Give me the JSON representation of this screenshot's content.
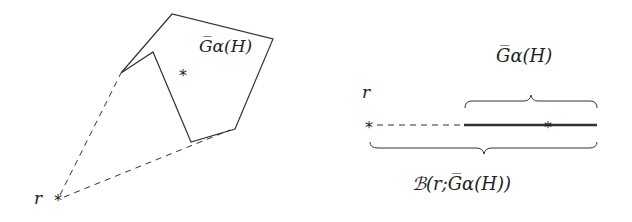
{
  "left_figure": {
    "set_label": "G̅α(H)",
    "point_label": "r",
    "polygon_points": [
      [
        121,
        73
      ],
      [
        172,
        14
      ],
      [
        273,
        39
      ],
      [
        235,
        129
      ],
      [
        191,
        142
      ],
      [
        153,
        52
      ]
    ],
    "interior_point": [
      182,
      72
    ],
    "external_point": [
      58,
      198
    ]
  },
  "right_figure": {
    "point_label": "r",
    "top_brace_label": "G̅α(H)",
    "bottom_brace_label": "ℬ(r;G̅α(H))",
    "segment_start": 465,
    "segment_end": 597,
    "interior_point_x": 548,
    "external_point_x": 369
  }
}
